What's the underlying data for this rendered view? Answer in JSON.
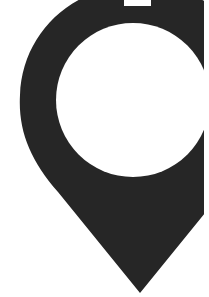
{
  "image": {
    "subject": "map-pin",
    "description": "Cropped location marker pin icon",
    "colors": {
      "background": "#ffffff",
      "pin": "#262626",
      "hole": "#ffffff"
    }
  }
}
